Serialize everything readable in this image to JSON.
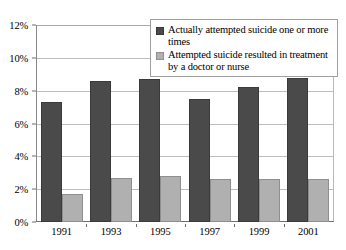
{
  "chart_data": {
    "type": "bar",
    "title": "",
    "subtitle": "",
    "xlabel": "",
    "ylabel": "",
    "categories": [
      "1991",
      "1993",
      "1995",
      "1997",
      "1999",
      "2001"
    ],
    "series": [
      {
        "name": "Actually attempted suicide one or more times",
        "color": "#4a4a4a",
        "values": [
          7.3,
          8.6,
          8.7,
          7.5,
          8.2,
          8.8
        ]
      },
      {
        "name": "Attempted suicide resulted in treatment by a doctor or nurse",
        "color": "#b0b0b0",
        "values": [
          1.7,
          2.7,
          2.8,
          2.6,
          2.6,
          2.6
        ]
      }
    ],
    "ylim": [
      0,
      12
    ],
    "ytick_step": 2,
    "ytick_labels": [
      "0%",
      "2%",
      "4%",
      "6%",
      "8%",
      "10%",
      "12%"
    ],
    "ytick_values": [
      0,
      2,
      4,
      6,
      8,
      10,
      12
    ],
    "grid": true,
    "grid_axis": "y",
    "legend_position": "top-right",
    "value_suffix": "%"
  },
  "legend": {
    "entries": [
      {
        "label": "Actually attempted suicide one or more times"
      },
      {
        "label": "Attempted suicide resulted in treatment by a doctor or nurse"
      }
    ]
  }
}
